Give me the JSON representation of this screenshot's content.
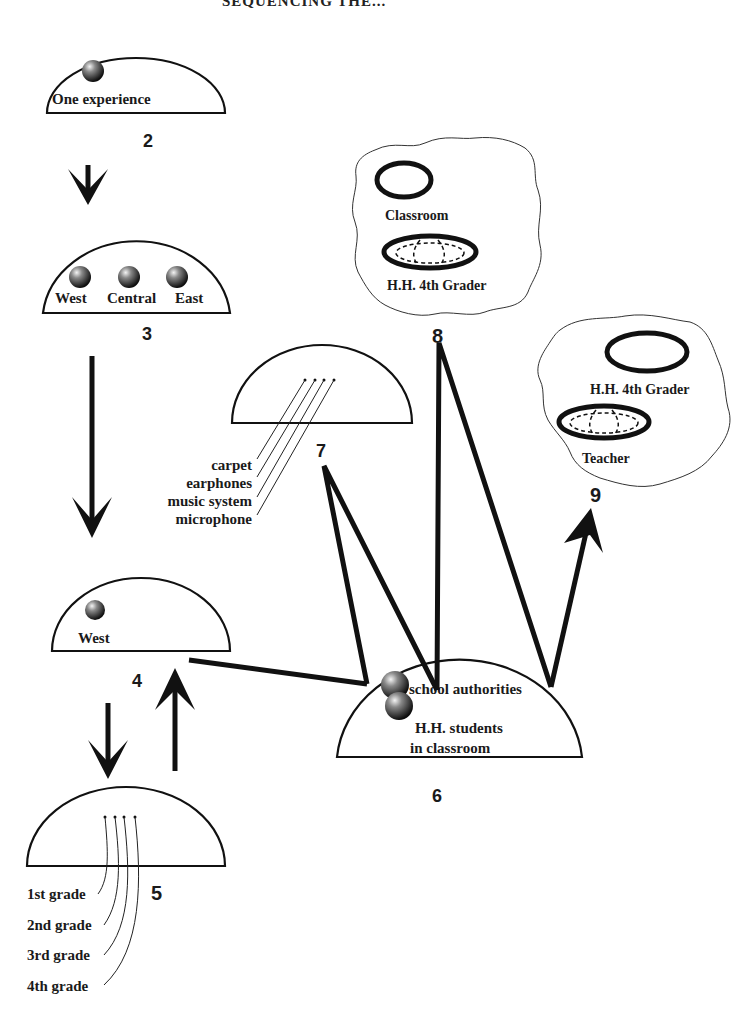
{
  "header": {
    "title": "SEQUENCING THE..."
  },
  "colors": {
    "ink": "#111111",
    "background": "#ffffff",
    "ball_light": "#e8e8e8",
    "ball_dark": "#111111"
  },
  "nodes": {
    "n2": {
      "number": "2",
      "label": "One experience"
    },
    "n3": {
      "number": "3",
      "labels": [
        "West",
        "Central",
        "East"
      ]
    },
    "n4": {
      "number": "4",
      "label": "West"
    },
    "n5": {
      "number": "5",
      "labels": [
        "1st grade",
        "2nd grade",
        "3rd grade",
        "4th grade"
      ]
    },
    "n6": {
      "number": "6",
      "label_top": "school authorities",
      "label_mid": "H.H. students",
      "label_bot": "in classroom"
    },
    "n7": {
      "number": "7",
      "labels": [
        "carpet",
        "earphones",
        "music system",
        "microphone"
      ]
    },
    "n8": {
      "number": "8",
      "outer_label": "Classroom",
      "inner_label": "H.H. 4th Grader"
    },
    "n9": {
      "number": "9",
      "outer_label": "H.H. 4th Grader",
      "inner_label": "Teacher"
    }
  },
  "edges": [
    {
      "from": "2",
      "to": "3",
      "type": "arrow"
    },
    {
      "from": "3",
      "to": "4",
      "type": "arrow"
    },
    {
      "from": "4",
      "to": "5",
      "type": "arrow"
    },
    {
      "from": "5",
      "to": "4",
      "type": "arrow"
    },
    {
      "from": "4",
      "to": "6",
      "type": "line"
    },
    {
      "from": "6",
      "to": "7",
      "type": "zigzag"
    },
    {
      "from": "6",
      "to": "8",
      "type": "zigzag"
    },
    {
      "from": "6",
      "to": "9",
      "type": "arrow"
    }
  ],
  "icons": {
    "ball": "sphere-icon",
    "ring": "ellipse-ring-icon",
    "nested_ring": "nested-ellipse-icon",
    "cloud": "cloud-shape-icon"
  }
}
